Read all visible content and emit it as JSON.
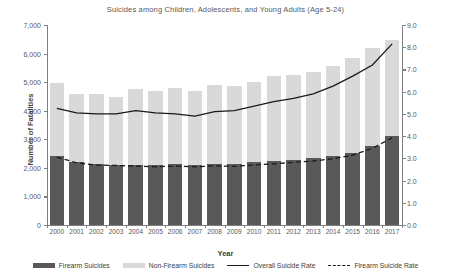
{
  "chart_data": {
    "type": "bar",
    "title": "Suicides among Children, Adolescents, and Young Adults (Age 5-24)",
    "xlabel": "Year",
    "ylabel": "Number of Fatalities",
    "ylabel_secondary": "Fatality Rate (per 100,000)",
    "categories": [
      "2000",
      "2001",
      "2002",
      "2003",
      "2004",
      "2005",
      "2006",
      "2007",
      "2008",
      "2009",
      "2010",
      "2011",
      "2012",
      "2013",
      "2014",
      "2015",
      "2016",
      "2017"
    ],
    "ylim": [
      0,
      7000
    ],
    "yticks": [
      "0",
      "1,000",
      "2,000",
      "3,000",
      "4,000",
      "5,000",
      "6,000",
      "7,000"
    ],
    "ytick_values": [
      0,
      1000,
      2000,
      3000,
      4000,
      5000,
      6000,
      7000
    ],
    "ylim_secondary": [
      0,
      9
    ],
    "yticks_secondary": [
      "0.0",
      "1.0",
      "2.0",
      "3.0",
      "4.0",
      "5.0",
      "6.0",
      "7.0",
      "8.0",
      "9.0"
    ],
    "ytick_values_secondary": [
      0,
      1,
      2,
      3,
      4,
      5,
      6,
      7,
      8,
      9
    ],
    "grid": false,
    "legend_position": "bottom",
    "stacked": true,
    "series": [
      {
        "name": "Firearm Suicides",
        "type": "bar",
        "color": "#595959",
        "axis": "left",
        "values": [
          2400,
          2200,
          2120,
          2110,
          2100,
          2090,
          2120,
          2110,
          2150,
          2130,
          2200,
          2240,
          2280,
          2330,
          2400,
          2530,
          2750,
          3100
        ]
      },
      {
        "name": "Non-Firearm Suicides",
        "type": "bar",
        "color": "#d9d9d9",
        "axis": "left",
        "values": [
          2570,
          2380,
          2460,
          2380,
          2650,
          2600,
          2680,
          2570,
          2750,
          2720,
          2800,
          2960,
          2980,
          3020,
          3150,
          3300,
          3450,
          3360
        ]
      },
      {
        "name": "Overall Suicide Rate",
        "type": "line",
        "style": "solid",
        "color": "#1a1a1a",
        "axis": "right",
        "values": [
          5.25,
          5.05,
          5.0,
          5.0,
          5.15,
          5.05,
          5.0,
          4.9,
          5.1,
          5.15,
          5.35,
          5.55,
          5.7,
          5.9,
          6.25,
          6.7,
          7.2,
          8.15
        ]
      },
      {
        "name": "Firearm Suicide Rate",
        "type": "line",
        "style": "dashed",
        "color": "#1a1a1a",
        "axis": "right",
        "values": [
          3.05,
          2.8,
          2.7,
          2.68,
          2.65,
          2.62,
          2.65,
          2.62,
          2.66,
          2.64,
          2.7,
          2.75,
          2.82,
          2.88,
          2.98,
          3.15,
          3.45,
          3.92
        ]
      }
    ]
  }
}
